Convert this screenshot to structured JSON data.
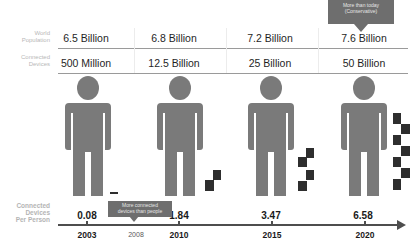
{
  "rows": {
    "population": {
      "label_line1": "World",
      "label_line2": "Population",
      "values": [
        "6.5 Billion",
        "6.8 Billion",
        "7.2 Billion",
        "7.6 Billion"
      ]
    },
    "devices": {
      "label_line1": "Connected",
      "label_line2": "Devices",
      "values": [
        "500 Million",
        "12.5 Billion",
        "25 Billion",
        "50 Billion"
      ]
    }
  },
  "per_person": {
    "label_line1": "Connected",
    "label_line2": "Devices",
    "label_line3": "Per Person",
    "values": [
      "0.08",
      "1.84",
      "3.47",
      "6.58"
    ]
  },
  "timeline": {
    "years": [
      "2003",
      "2010",
      "2015",
      "2020"
    ],
    "milestone_year": "2008"
  },
  "callouts": {
    "top_line1": "More than today",
    "top_line2": "(Conservative)",
    "milestone_line1": "More connected",
    "milestone_line2": "devices than people"
  },
  "colors": {
    "person": "#7a7a7a",
    "device": "#2e2e2e",
    "callout": "#6e6e6e"
  }
}
